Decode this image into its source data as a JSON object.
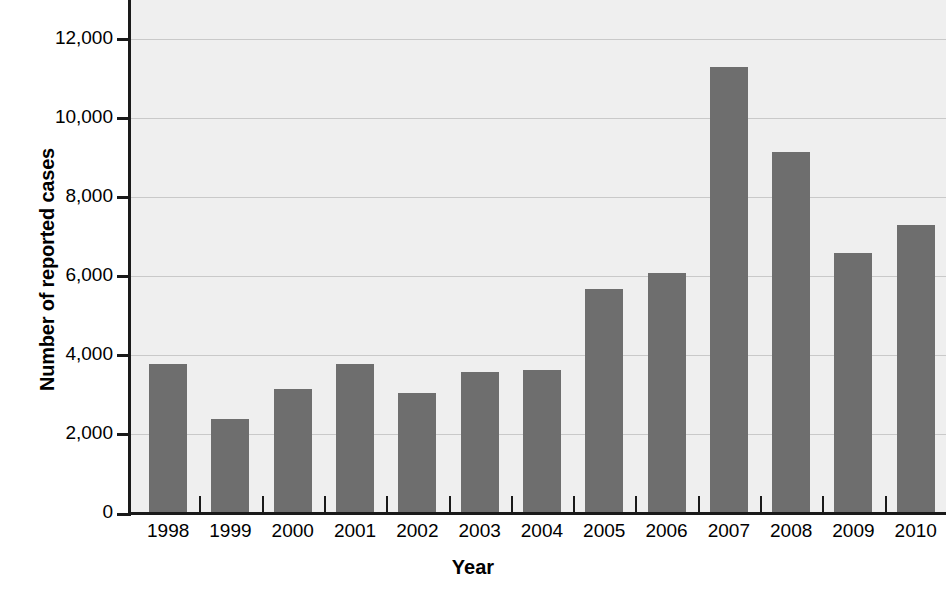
{
  "chart_data": {
    "type": "bar",
    "title": "",
    "xlabel": "Year",
    "ylabel": "Number of reported cases",
    "categories": [
      "1998",
      "1999",
      "2000",
      "2001",
      "2002",
      "2003",
      "2004",
      "2005",
      "2006",
      "2007",
      "2008",
      "2009",
      "2010"
    ],
    "values": [
      3800,
      2400,
      3150,
      3800,
      3050,
      3600,
      3650,
      5700,
      6100,
      11300,
      9150,
      6600,
      7300
    ],
    "ylim": [
      0,
      13000
    ],
    "xlim_note": "last bar (2010) is clipped at the right edge of the figure",
    "ytick_values": [
      0,
      2000,
      4000,
      6000,
      8000,
      10000,
      12000
    ],
    "ytick_labels": [
      "0",
      "2,000",
      "4,000",
      "6,000",
      "8,000",
      "10,000",
      "12,000"
    ],
    "grid": "horizontal gridlines at each y tick above 0",
    "legend": "none",
    "colors": {
      "bar": "#6e6e6e",
      "plot_background": "#efefef",
      "gridline": "#c9c9c9",
      "axis": "#1a1a1a",
      "text": "#000000",
      "figure_background": "#ffffff"
    }
  }
}
